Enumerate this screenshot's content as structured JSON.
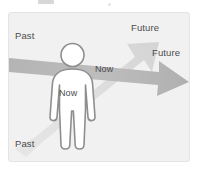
{
  "figure": {
    "background_color": "#f1f1f1",
    "border_color": "#e4e4e4",
    "page_background": "#ffffff"
  },
  "labels": {
    "past_upper": "Past",
    "past_lower": "Past",
    "future_diagonal": "Future",
    "future_horizontal": "Future",
    "now_on_arrow": "Now",
    "now_in_body": "Now",
    "text_color": "#4c4c4c"
  },
  "arrows": [
    {
      "name": "horizontal-time-arrow",
      "from_label": "Past",
      "to_label": "Future",
      "shaft_label": "Now",
      "color": "#b9b9b9",
      "orientation": "horizontal-slightly-descending"
    },
    {
      "name": "diagonal-time-arrow",
      "from_label": "Past",
      "to_label": "Future",
      "color": "#dcdcdc",
      "orientation": "lower-left-to-upper-right"
    }
  ],
  "person": {
    "name": "human-silhouette",
    "fill_color": "#ffffff",
    "outline_color": "#8e8e8e",
    "body_label": "Now"
  }
}
